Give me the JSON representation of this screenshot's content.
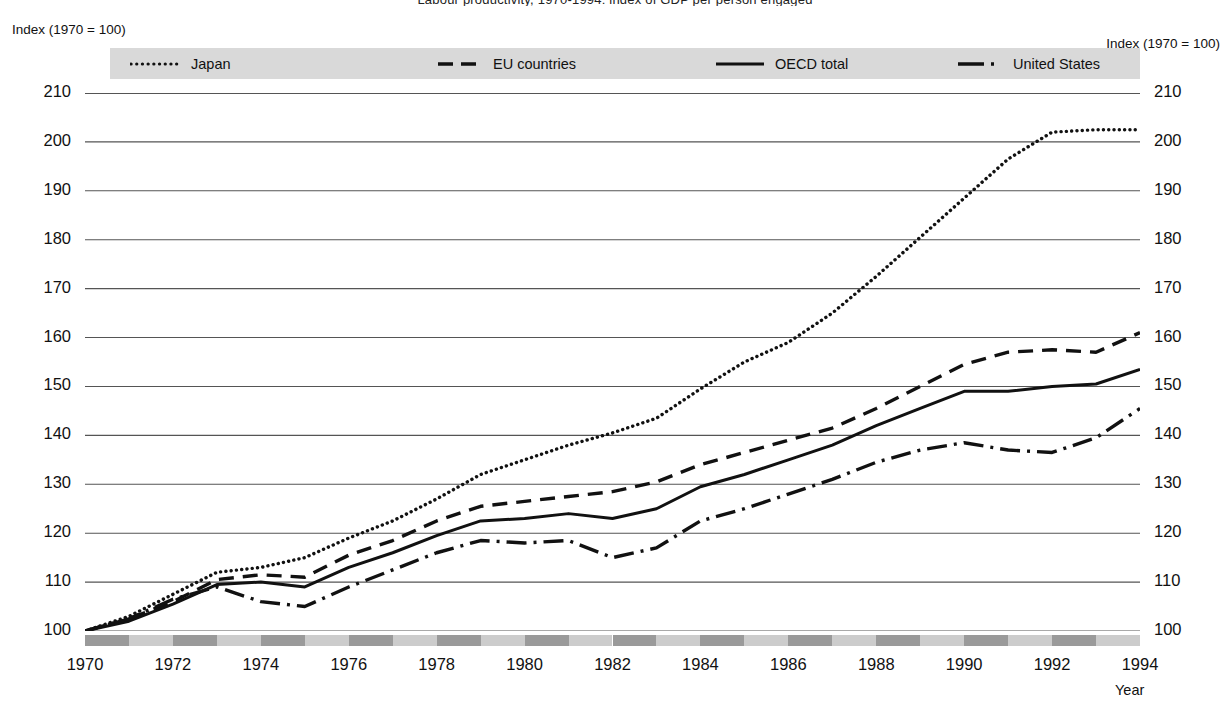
{
  "title": "Labour productivity, 1970-1994: index of GDP per person engaged",
  "axis_caption_left": "Index (1970 = 100)",
  "axis_caption_right": "Index (1970 = 100)",
  "x_axis_caption": "Year",
  "legend": [
    {
      "key": "japan",
      "label": "Japan",
      "style": "dotted"
    },
    {
      "key": "eu",
      "label": "EU countries",
      "style": "dashed"
    },
    {
      "key": "oecd",
      "label": "OECD total",
      "style": "solid"
    },
    {
      "key": "us",
      "label": "United States",
      "style": "dash-dot"
    }
  ],
  "colors": {
    "line": "#111111",
    "grid": "#555555",
    "legend_band": "#d9d9d9",
    "xband_dark": "#9a9a9a",
    "xband_light": "#cccccc",
    "text": "#111111"
  },
  "chart_data": {
    "type": "line",
    "title": "Labour productivity, 1970-1994: index of GDP per person engaged",
    "xlabel": "Year",
    "ylabel": "Index (1970 = 100)",
    "xlim": [
      1970,
      1994
    ],
    "ylim": [
      100,
      210
    ],
    "yticks": [
      100,
      110,
      120,
      130,
      140,
      150,
      160,
      170,
      180,
      190,
      200,
      210
    ],
    "xticks": [
      1970,
      1972,
      1974,
      1976,
      1978,
      1980,
      1982,
      1984,
      1986,
      1988,
      1990,
      1992,
      1994
    ],
    "grid": true,
    "legend_position": "top",
    "x": [
      1970,
      1971,
      1972,
      1973,
      1974,
      1975,
      1976,
      1977,
      1978,
      1979,
      1980,
      1981,
      1982,
      1983,
      1984,
      1985,
      1986,
      1987,
      1988,
      1989,
      1990,
      1991,
      1992,
      1993,
      1994
    ],
    "series": [
      {
        "name": "Japan",
        "style": "dotted",
        "values": [
          100.0,
          103.0,
          107.5,
          112.0,
          113.0,
          115.0,
          119.0,
          122.5,
          127.0,
          132.0,
          135.0,
          138.0,
          140.5,
          143.5,
          149.5,
          155.0,
          159.0,
          165.0,
          172.5,
          180.5,
          188.5,
          196.5,
          202.0,
          202.5,
          202.5
        ]
      },
      {
        "name": "EU countries",
        "style": "dashed",
        "values": [
          100.0,
          102.5,
          106.0,
          110.5,
          111.5,
          111.0,
          115.5,
          118.5,
          122.5,
          125.5,
          126.5,
          127.5,
          128.5,
          130.5,
          134.0,
          136.5,
          139.0,
          141.5,
          145.5,
          150.0,
          154.5,
          157.0,
          157.5,
          157.0,
          161.0
        ]
      },
      {
        "name": "OECD total",
        "style": "solid",
        "values": [
          100.0,
          102.0,
          105.5,
          109.5,
          110.0,
          109.0,
          113.0,
          116.0,
          119.5,
          122.5,
          123.0,
          124.0,
          123.0,
          125.0,
          129.5,
          132.0,
          135.0,
          138.0,
          142.0,
          145.5,
          149.0,
          149.0,
          150.0,
          150.5,
          153.5
        ]
      },
      {
        "name": "United States",
        "style": "dash-dot",
        "values": [
          100.0,
          102.5,
          106.5,
          109.0,
          106.0,
          105.0,
          109.0,
          112.5,
          116.0,
          118.5,
          118.0,
          118.5,
          115.0,
          117.0,
          122.5,
          125.0,
          128.0,
          131.0,
          134.5,
          137.0,
          138.5,
          137.0,
          136.5,
          139.5,
          145.5
        ]
      }
    ]
  }
}
